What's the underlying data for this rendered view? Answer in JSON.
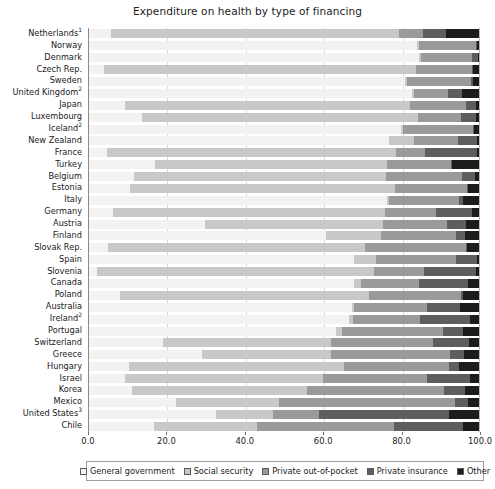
{
  "chart_data": {
    "type": "bar",
    "subtype": "horizontal-stacked-100",
    "title": "Expenditure on health by type of financing",
    "xlabel": "",
    "ylabel": "",
    "xlim": [
      0,
      100
    ],
    "xticks": [
      "0.0",
      "20.0",
      "40.0",
      "60.0",
      "80.0",
      "100.0"
    ],
    "xtick_values": [
      0,
      20,
      40,
      60,
      80,
      100
    ],
    "grid": true,
    "legend_position": "bottom",
    "series": [
      {
        "name": "General government",
        "color": "#f2f2f2"
      },
      {
        "name": "Social security",
        "color": "#c8c8c8"
      },
      {
        "name": "Private out-of-pocket",
        "color": "#9a9a9a"
      },
      {
        "name": "Private insurance",
        "color": "#5e5e5e"
      },
      {
        "name": "Other",
        "color": "#1c1c1c"
      }
    ],
    "categories": [
      "Netherlands",
      "Norway",
      "Denmark",
      "Czech Rep.",
      "Sweden",
      "United Kingdom",
      "Japan",
      "Luxembourg",
      "Iceland",
      "New Zealand",
      "France",
      "Turkey",
      "Belgium",
      "Estonia",
      "Italy",
      "Germany",
      "Austria",
      "Finland",
      "Slovak Rep.",
      "Spain",
      "Slovenia",
      "Canada",
      "Poland",
      "Australia",
      "Ireland",
      "Portugal",
      "Switzerland",
      "Greece",
      "Hungary",
      "Israel",
      "Korea",
      "Mexico",
      "United States",
      "Chile"
    ],
    "category_footnotes": {
      "Netherlands": "1",
      "United Kingdom": "2",
      "Iceland": "2",
      "Ireland": "2",
      "United States": "3"
    },
    "rows": [
      {
        "label": "Netherlands",
        "footnote": "1",
        "values": [
          5.9,
          73.6,
          6.2,
          5.8,
          8.5
        ]
      },
      {
        "label": "Norway",
        "footnote": "",
        "values": [
          84.8,
          0.0,
          14.6,
          0.1,
          0.5
        ]
      },
      {
        "label": "Denmark",
        "footnote": "",
        "values": [
          85.3,
          0.0,
          13.2,
          1.5,
          0.0
        ]
      },
      {
        "label": "Czech Rep.",
        "footnote": "",
        "values": [
          4.0,
          80.0,
          14.3,
          0.2,
          1.5
        ]
      },
      {
        "label": "Sweden",
        "footnote": "",
        "values": [
          81.4,
          0.0,
          16.6,
          0.4,
          1.6
        ]
      },
      {
        "label": "United Kingdom",
        "footnote": "2",
        "values": [
          83.2,
          0.0,
          8.9,
          3.6,
          4.3
        ]
      },
      {
        "label": "Japan",
        "footnote": "",
        "values": [
          9.6,
          72.7,
          14.4,
          2.5,
          0.8
        ]
      },
      {
        "label": "Luxembourg",
        "footnote": "",
        "values": [
          13.8,
          70.5,
          11.1,
          3.8,
          0.8
        ]
      },
      {
        "label": "Iceland",
        "footnote": "2",
        "values": [
          80.6,
          0.0,
          18.0,
          0.0,
          1.4
        ]
      },
      {
        "label": "New Zealand",
        "footnote": "",
        "values": [
          77.3,
          6.1,
          11.1,
          4.9,
          0.6
        ]
      },
      {
        "label": "France",
        "footnote": "",
        "values": [
          4.9,
          73.7,
          7.6,
          13.2,
          0.6
        ]
      },
      {
        "label": "Turkey",
        "footnote": "",
        "values": [
          17.3,
          59.1,
          16.3,
          0.4,
          6.9
        ]
      },
      {
        "label": "Belgium",
        "footnote": "",
        "values": [
          11.7,
          64.4,
          19.6,
          3.4,
          0.9
        ]
      },
      {
        "label": "Estonia",
        "footnote": "",
        "values": [
          10.9,
          67.6,
          18.6,
          0.2,
          2.7
        ]
      },
      {
        "label": "Italy",
        "footnote": "",
        "values": [
          76.6,
          0.3,
          18.0,
          0.9,
          4.2
        ]
      },
      {
        "label": "Germany",
        "footnote": "",
        "values": [
          6.4,
          69.4,
          13.1,
          9.4,
          1.7
        ]
      },
      {
        "label": "Austria",
        "footnote": "",
        "values": [
          30.0,
          45.3,
          16.5,
          4.9,
          3.3
        ]
      },
      {
        "label": "Finland",
        "footnote": "",
        "values": [
          60.9,
          14.1,
          19.1,
          2.2,
          3.7
        ]
      },
      {
        "label": "Slovak Rep.",
        "footnote": "",
        "values": [
          5.2,
          65.6,
          25.8,
          0.2,
          3.2
        ]
      },
      {
        "label": "Spain",
        "footnote": "",
        "values": [
          68.1,
          5.4,
          20.7,
          5.2,
          0.6
        ]
      },
      {
        "label": "Slovenia",
        "footnote": "",
        "values": [
          2.4,
          70.6,
          12.8,
          13.4,
          0.8
        ]
      },
      {
        "label": "Canada",
        "footnote": "",
        "values": [
          68.3,
          1.5,
          14.7,
          12.8,
          2.7
        ]
      },
      {
        "label": "Poland",
        "footnote": "",
        "values": [
          8.1,
          63.8,
          23.5,
          0.6,
          4.0
        ]
      },
      {
        "label": "Australia",
        "footnote": "",
        "values": [
          67.9,
          0.0,
          18.8,
          8.4,
          4.9
        ]
      },
      {
        "label": "Ireland",
        "footnote": "2",
        "values": [
          66.9,
          0.8,
          17.1,
          12.9,
          2.3
        ]
      },
      {
        "label": "Portugal",
        "footnote": "",
        "values": [
          63.7,
          1.2,
          26.0,
          5.0,
          4.1
        ]
      },
      {
        "label": "Switzerland",
        "footnote": "",
        "values": [
          19.3,
          42.8,
          26.0,
          9.4,
          2.5
        ]
      },
      {
        "label": "Greece",
        "footnote": "",
        "values": [
          29.3,
          32.8,
          30.5,
          3.6,
          3.8
        ]
      },
      {
        "label": "Hungary",
        "footnote": "",
        "values": [
          10.4,
          54.9,
          26.9,
          2.8,
          5.0
        ]
      },
      {
        "label": "Israel",
        "footnote": "",
        "values": [
          9.5,
          50.6,
          26.5,
          11.0,
          2.4
        ]
      },
      {
        "label": "Korea",
        "footnote": "",
        "values": [
          11.3,
          44.6,
          35.2,
          5.4,
          3.5
        ]
      },
      {
        "label": "Mexico",
        "footnote": "",
        "values": [
          22.6,
          26.1,
          45.1,
          3.4,
          2.8
        ]
      },
      {
        "label": "United States",
        "footnote": "3",
        "values": [
          32.9,
          14.2,
          11.8,
          33.4,
          7.7
        ]
      },
      {
        "label": "Chile",
        "footnote": "",
        "values": [
          17.0,
          26.2,
          34.9,
          17.8,
          4.1
        ]
      }
    ]
  },
  "legend": {
    "items": [
      {
        "label": "General government",
        "swatch": "#f2f2f2"
      },
      {
        "label": "Social security",
        "swatch": "#c8c8c8"
      },
      {
        "label": "Private out-of-pocket",
        "swatch": "#9a9a9a"
      },
      {
        "label": "Private insurance",
        "swatch": "#5e5e5e"
      },
      {
        "label": "Other",
        "swatch": "#1c1c1c"
      }
    ]
  }
}
